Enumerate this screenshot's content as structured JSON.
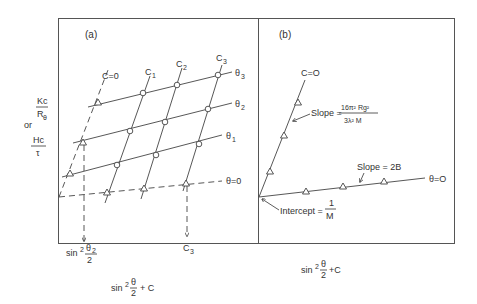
{
  "figure": {
    "panel_a": {
      "label": "(a)",
      "y_axis": {
        "top_num": "Kc",
        "top_den": "R",
        "top_den_sub": "θ",
        "or": "or",
        "bottom_num": "Hc",
        "bottom_den": "τ"
      },
      "x_axis": {
        "label_sin": "sin",
        "label_sup": "2",
        "label_frac_num": "θ",
        "label_frac_den": "2",
        "label_tail": "+ C"
      },
      "concentration_lines": [
        "C=0",
        "C",
        "C",
        "C"
      ],
      "concentration_subs": [
        "",
        "1",
        "2",
        "3"
      ],
      "angle_lines": [
        "θ",
        "θ",
        "θ",
        "θ=0"
      ],
      "angle_subs": [
        "3",
        "2",
        "1",
        ""
      ],
      "marker_sin": "sin",
      "marker_sup": "2",
      "marker_num": "θ",
      "marker_num_sub": "2",
      "marker_den": "2",
      "marker_c": "C",
      "marker_c_sub": "3"
    },
    "panel_b": {
      "label": "(b)",
      "c0_label": "C=O",
      "theta0_label": "θ=O",
      "slope1_prefix": "Slope =",
      "slope1_num": "16π² Rg²",
      "slope1_den": "3λ² M",
      "slope2": "Slope = 2B",
      "intercept_prefix": "Intercept =",
      "intercept_num": "1",
      "intercept_den": "M",
      "x_axis": {
        "label_sin": "sin",
        "label_sup": "2",
        "label_frac_num": "θ",
        "label_frac_den": "2",
        "label_tail": "+C"
      }
    },
    "colors": {
      "ink": "#333333",
      "background": "#ffffff"
    }
  }
}
